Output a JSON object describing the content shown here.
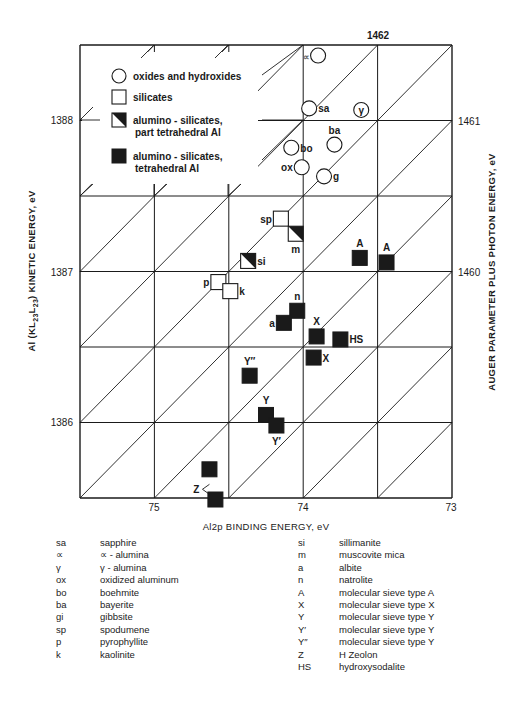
{
  "chart_data": {
    "type": "scatter",
    "title": "",
    "xlabel": "Al2p BINDING ENERGY, eV",
    "ylabel": "Al (KL23L23) KINETIC ENERGY, eV",
    "y2label": "AUGER PARAMETER PLUS PHOTON ENERGY, eV",
    "x_reversed": true,
    "xlim": [
      75.5,
      73.0
    ],
    "ylim": [
      1385.5,
      1388.5
    ],
    "x_ticks": [
      75,
      74,
      73
    ],
    "y_ticks": [
      1386,
      1387,
      1388
    ],
    "auger_parameter_lines": [
      1460,
      1461,
      1462
    ],
    "grid": true,
    "grid_step_x": 0.5,
    "grid_step_y": 0.5,
    "legend_position": "upper-left (inside plot)",
    "legend": [
      {
        "marker": "circle",
        "label": "oxides and hydroxides"
      },
      {
        "marker": "square-open",
        "label": "silicates"
      },
      {
        "marker": "square-half",
        "label": "alumino - silicates,",
        "label2": "part tetrahedral Al"
      },
      {
        "marker": "square-filled",
        "label": "alumino - silicates,",
        "label2": "tetrahedral Al"
      }
    ],
    "series": [
      {
        "name": "oxides and hydroxides",
        "marker": "circle",
        "points": [
          {
            "label": "∝",
            "x": 73.9,
            "y": 1388.43,
            "label_side": "left"
          },
          {
            "label": "sa",
            "x": 73.96,
            "y": 1388.08,
            "label_side": "right"
          },
          {
            "label": "γ",
            "x": 73.61,
            "y": 1388.07,
            "label_side": "inside"
          },
          {
            "label": "ba",
            "x": 73.79,
            "y": 1387.84,
            "label_side": "top"
          },
          {
            "label": "bo",
            "x": 74.08,
            "y": 1387.82,
            "label_side": "right"
          },
          {
            "label": "ox",
            "x": 74.01,
            "y": 1387.69,
            "label_side": "left"
          },
          {
            "label": "g",
            "x": 73.86,
            "y": 1387.63,
            "label_side": "right"
          }
        ]
      },
      {
        "name": "silicates",
        "marker": "square-open",
        "points": [
          {
            "label": "sp",
            "x": 74.15,
            "y": 1387.35,
            "label_side": "left"
          },
          {
            "label": "p",
            "x": 74.57,
            "y": 1386.93,
            "label_side": "left"
          },
          {
            "label": "k",
            "x": 74.49,
            "y": 1386.87,
            "label_side": "right"
          }
        ]
      },
      {
        "name": "alumino-silicates, part tetrahedral Al",
        "marker": "square-half",
        "points": [
          {
            "label": "m",
            "x": 74.05,
            "y": 1387.25,
            "label_side": "bottom"
          },
          {
            "label": "si",
            "x": 74.37,
            "y": 1387.07,
            "label_side": "right"
          }
        ]
      },
      {
        "name": "alumino-silicates, tetrahedral Al",
        "marker": "square-filled",
        "points": [
          {
            "label": "A",
            "x": 73.62,
            "y": 1387.09,
            "label_side": "top"
          },
          {
            "label": "A",
            "x": 73.44,
            "y": 1387.06,
            "label_side": "top"
          },
          {
            "label": "n",
            "x": 74.04,
            "y": 1386.74,
            "label_side": "top"
          },
          {
            "label": "a",
            "x": 74.13,
            "y": 1386.66,
            "label_side": "left"
          },
          {
            "label": "X",
            "x": 73.91,
            "y": 1386.57,
            "label_side": "top"
          },
          {
            "label": "HS",
            "x": 73.75,
            "y": 1386.55,
            "label_side": "right"
          },
          {
            "label": "X",
            "x": 73.93,
            "y": 1386.43,
            "label_side": "right"
          },
          {
            "label": "Y″",
            "x": 74.36,
            "y": 1386.31,
            "label_side": "top"
          },
          {
            "label": "Y",
            "x": 74.25,
            "y": 1386.05,
            "label_side": "top"
          },
          {
            "label": "Y′",
            "x": 74.18,
            "y": 1385.98,
            "label_side": "bottom"
          },
          {
            "label": "Z",
            "x": 74.63,
            "y": 1385.69,
            "label_side": "left-bottom"
          },
          {
            "label": "",
            "x": 74.59,
            "y": 1385.49,
            "label_side": "none"
          }
        ]
      }
    ]
  },
  "axes": {
    "xlabel": "Al2p BINDING ENERGY, eV",
    "ylabel_prefix": "Al (KL",
    "ylabel_sub1": "23",
    "ylabel_mid": "L",
    "ylabel_sub2": "23",
    "ylabel_suffix": ") KINETIC ENERGY, eV",
    "y2label": "AUGER PARAMETER PLUS PHOTON ENERGY, eV",
    "x_tick_labels": [
      "75",
      "74",
      "73"
    ],
    "y_tick_labels": [
      "1386",
      "1387",
      "1388"
    ],
    "auger_labels": [
      "1460",
      "1461",
      "1462"
    ]
  },
  "legend_box": {
    "items": [
      {
        "label": "oxides and hydroxides"
      },
      {
        "label": "silicates"
      },
      {
        "label": "alumino - silicates,",
        "label2": "part tetrahedral Al"
      },
      {
        "label": "alumino - silicates,",
        "label2": "tetrahedral Al"
      }
    ]
  },
  "abbreviations": {
    "left": [
      {
        "abbr": "sa",
        "name": "sapphire"
      },
      {
        "abbr": "∝",
        "name": "∝ - alumina"
      },
      {
        "abbr": "γ",
        "name": "γ - alumina"
      },
      {
        "abbr": "ox",
        "name": "oxidized aluminum"
      },
      {
        "abbr": "bo",
        "name": "boehmite"
      },
      {
        "abbr": "ba",
        "name": "bayerite"
      },
      {
        "abbr": "gi",
        "name": "gibbsite"
      },
      {
        "abbr": "sp",
        "name": "spodumene"
      },
      {
        "abbr": "p",
        "name": "pyrophyllite"
      },
      {
        "abbr": "k",
        "name": "kaolinite"
      }
    ],
    "right": [
      {
        "abbr": "si",
        "name": "sillimanite"
      },
      {
        "abbr": "m",
        "name": "muscovite mica"
      },
      {
        "abbr": "a",
        "name": "albite"
      },
      {
        "abbr": "n",
        "name": "natrolite"
      },
      {
        "abbr": "A",
        "name": "molecular sieve type A"
      },
      {
        "abbr": "X",
        "name": "molecular sieve type X"
      },
      {
        "abbr": "Y",
        "name": "molecular sieve type Y"
      },
      {
        "abbr": "Y′",
        "name": "molecular sieve type Y"
      },
      {
        "abbr": "Y″",
        "name": "molecular sieve  type Y"
      },
      {
        "abbr": "Z",
        "name": "H Zeolon"
      },
      {
        "abbr": "HS",
        "name": "hydroxysodalite"
      }
    ]
  },
  "colors": {
    "ink": "#1a1a1a",
    "background": "#ffffff"
  }
}
